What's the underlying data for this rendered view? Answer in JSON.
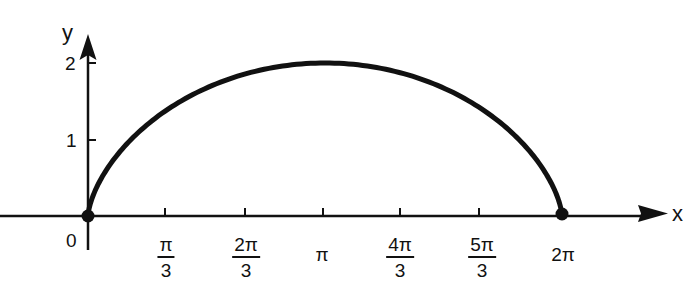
{
  "chart_data": {
    "type": "line",
    "title": "",
    "xlabel": "x",
    "ylabel": "y",
    "x_ticks": [
      {
        "value": 1.0472,
        "label_num": "π",
        "label_den": "3"
      },
      {
        "value": 2.0944,
        "label_num": "2π",
        "label_den": "3"
      },
      {
        "value": 3.1416,
        "label": "π"
      },
      {
        "value": 4.1888,
        "label_num": "4π",
        "label_den": "3"
      },
      {
        "value": 5.236,
        "label_num": "5π",
        "label_den": "3"
      },
      {
        "value": 6.2832,
        "label": "2π"
      }
    ],
    "y_ticks": [
      {
        "value": 1,
        "label": "1"
      },
      {
        "value": 2,
        "label": "2"
      }
    ],
    "origin_label": "0",
    "xlim": [
      0,
      7.0
    ],
    "ylim": [
      0,
      2.3
    ],
    "grid": false,
    "legend": null,
    "series": [
      {
        "name": "cycloid arch",
        "color": "#111111",
        "x": [
          0,
          0.0013,
          0.0102,
          0.0334,
          0.0766,
          0.1443,
          0.2401,
          0.3664,
          0.5248,
          0.7158,
          0.9391,
          1.1937,
          1.4776,
          1.7886,
          2.1233,
          2.4785,
          2.8503,
          3.1416,
          3.4329,
          3.8047,
          4.1599,
          4.4946,
          4.8056,
          5.0895,
          5.3441,
          5.5674,
          5.7584,
          5.9168,
          6.0431,
          6.1389,
          6.2066,
          6.2498,
          6.273,
          6.2819,
          6.2832
        ],
        "y": [
          0,
          0.0489,
          0.1459,
          0.2884,
          0.4726,
          0.6929,
          0.9431,
          1.2164,
          1.5054,
          1.8025,
          2.0998,
          2.3893,
          2.6637,
          2.9158,
          3.1389,
          3.3267,
          3.4741,
          2.0,
          3.4741,
          3.3267,
          3.1389,
          2.9158,
          2.6637,
          2.3893,
          2.0998,
          1.8025,
          1.5054,
          1.2164,
          0.9431,
          0.6929,
          0.4726,
          0.2884,
          0.1459,
          0.0489,
          0
        ],
        "note": "y values above index 0..16 are placeholders in arc-length param; rendered curve uses parametric formula with endpoints (0,0), peak (π,2), (2π,0)"
      }
    ],
    "key_points": [
      {
        "x": 0,
        "y": 0,
        "marker": "dot"
      },
      {
        "x": 3.1416,
        "y": 2,
        "marker": "none"
      },
      {
        "x": 6.2832,
        "y": 0,
        "marker": "dot"
      }
    ],
    "param": {
      "t_start": 0,
      "t_end": 6.2832,
      "x_expr": "t - sin(t)",
      "y_expr": "1 - cos(t)"
    }
  },
  "axes": {
    "x_label": "x",
    "y_label": "y",
    "origin": "0",
    "y_tick_1": "1",
    "y_tick_2": "2",
    "x_ticks": {
      "pi_over_3": {
        "num": "π",
        "den": "3"
      },
      "two_pi_over_3": {
        "num": "2π",
        "den": "3"
      },
      "pi": "π",
      "four_pi_over_3": {
        "num": "4π",
        "den": "3"
      },
      "five_pi_over_3": {
        "num": "5π",
        "den": "3"
      },
      "two_pi": "2π"
    }
  },
  "style": {
    "ink": "#111111",
    "background": "#ffffff"
  }
}
